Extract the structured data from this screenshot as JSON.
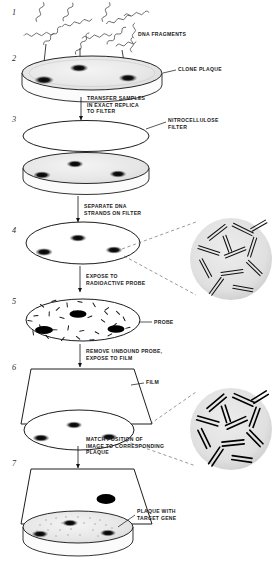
{
  "figure": {
    "type": "scientific-process-diagram",
    "steps": [
      {
        "number": "1",
        "name": "dna-fragments"
      },
      {
        "number": "2",
        "name": "clone-plaque-dish"
      },
      {
        "number": "3",
        "name": "nitrocellulose-filter-transfer"
      },
      {
        "number": "4",
        "name": "denatured-dna-on-filter"
      },
      {
        "number": "5",
        "name": "probe-hybridization"
      },
      {
        "number": "6",
        "name": "autoradiography-film"
      },
      {
        "number": "7",
        "name": "match-film-to-plate"
      }
    ],
    "labels": {
      "dna_fragments": "DNA FRAGMENTS",
      "clone_plaque": "CLONE PLAQUE",
      "nitrocellulose_filter": "NITROCELLULOSE\nFILTER",
      "probe": "PROBE",
      "film": "FILM",
      "plaque_with_target_gene": "PLAQUE WITH\nTARGET GENE"
    },
    "arrow_captions": {
      "transfer": "TRANSFER SAMPLES\nIN EXACT REPLICA\nTO FILTER",
      "separate": "SEPARATE DNA\nSTRANDS ON FILTER",
      "expose_probe": "EXPOSE TO\nRADIOACTIVE PROBE",
      "remove_probe": "REMOVE UNBOUND PROBE,\nEXPOSE TO FILM",
      "match": "MATCH POSITION OF\nIMAGE TO CORRESPONDING\nPLAQUE"
    },
    "insets": [
      {
        "name": "double-stranded-dna-inset",
        "step": "4"
      },
      {
        "name": "probe-bound-dna-inset",
        "step": "6"
      }
    ],
    "colors": {
      "ink": "#111111",
      "dish_fill": "#ededed",
      "plaque_spot": "#1a1a1a",
      "inset_fill": "#e4e4e4",
      "paper": "#ffffff"
    }
  }
}
